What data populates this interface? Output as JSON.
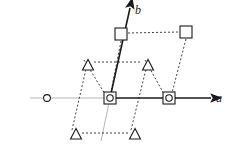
{
  "figure": {
    "width": 234,
    "height": 156,
    "background_color": "#ffffff"
  },
  "axes": {
    "a_axis": {
      "label": "a",
      "label_x": 216,
      "label_y": 102,
      "origin": {
        "x": 110,
        "y": 98
      },
      "tip": {
        "x": 211,
        "y": 98
      },
      "extension_start": {
        "x": 30,
        "y": 98
      },
      "color": "#1a1a1a",
      "extension_color": "#b5b5b5",
      "arrowhead": true
    },
    "b_axis": {
      "label": "b",
      "label_x": 135,
      "label_y": 14,
      "origin": {
        "x": 110,
        "y": 98
      },
      "tip": {
        "x": 130,
        "y": 8
      },
      "extension_end": {
        "x": 101,
        "y": 141
      },
      "color": "#1a1a1a",
      "extension_color": "#b5b5b5",
      "arrowhead": true
    }
  },
  "lattice": {
    "dash_color": "#2b2b2b",
    "dash_pattern": "2,2",
    "marker_stroke": "#1a1a1a",
    "markers": [
      {
        "type": "square-circle",
        "name": "origin-node",
        "x": 110,
        "y": 98,
        "size": 12,
        "circle_r": 3.2
      },
      {
        "type": "square-circle",
        "name": "lattice-node-a1",
        "x": 169,
        "y": 98,
        "size": 12,
        "circle_r": 3.2
      },
      {
        "type": "square",
        "name": "square-node-upper-left",
        "x": 121,
        "y": 34,
        "size": 12
      },
      {
        "type": "square",
        "name": "square-node-upper-right",
        "x": 186,
        "y": 32,
        "size": 12
      },
      {
        "type": "triangle",
        "name": "triangle-node-upper-left",
        "x": 88,
        "y": 65,
        "size": 10
      },
      {
        "type": "triangle",
        "name": "triangle-node-upper-right",
        "x": 148,
        "y": 65,
        "size": 10
      },
      {
        "type": "triangle",
        "name": "triangle-node-lower-left",
        "x": 76,
        "y": 134,
        "size": 10
      },
      {
        "type": "triangle",
        "name": "triangle-node-lower-right",
        "x": 135,
        "y": 134,
        "size": 10
      },
      {
        "type": "circle",
        "name": "circle-node-left",
        "x": 47,
        "y": 98,
        "circle_r": 3.4
      }
    ],
    "dashed_segments": [
      {
        "name": "dash-top-row",
        "x1": 128,
        "y1": 33,
        "x2": 179,
        "y2": 32
      },
      {
        "name": "dash-upper-triangle-row",
        "x1": 94,
        "y1": 62,
        "x2": 142,
        "y2": 62
      },
      {
        "name": "dash-lower-triangle-row",
        "x1": 82,
        "y1": 133,
        "x2": 129,
        "y2": 133
      },
      {
        "name": "dash-left-column-upper",
        "x1": 84,
        "y1": 60,
        "x2": 105,
        "y2": 94
      },
      {
        "name": "dash-left-column-lower",
        "x1": 72,
        "y1": 130,
        "x2": 86,
        "y2": 69
      },
      {
        "name": "dash-mid-column-upper",
        "x1": 145,
        "y1": 60,
        "x2": 164,
        "y2": 94
      },
      {
        "name": "dash-mid-column-lower",
        "x1": 131,
        "y1": 130,
        "x2": 146,
        "y2": 69
      },
      {
        "name": "dash-center-column-upper",
        "x1": 121,
        "y1": 41,
        "x2": 111,
        "y2": 92
      },
      {
        "name": "dash-right-column-upper",
        "x1": 186,
        "y1": 39,
        "x2": 172,
        "y2": 93
      }
    ]
  }
}
